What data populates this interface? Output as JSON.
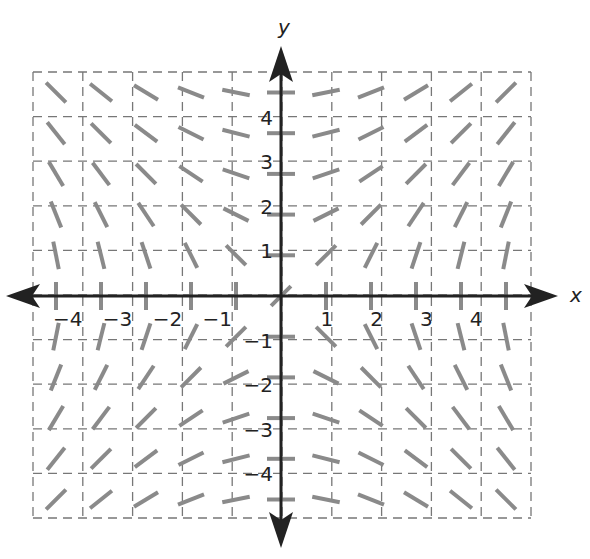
{
  "chart_data": {
    "type": "slope_field",
    "equation": "dy/dx = x/y",
    "title": "",
    "xlabel": "x",
    "ylabel": "y",
    "xlim": [
      -5,
      5
    ],
    "ylim": [
      -5,
      5
    ],
    "grid": true,
    "grid_style": "dashed",
    "x_tick_labels": [
      "−4",
      "−3",
      "−2",
      "−1",
      "1",
      "2",
      "3",
      "4"
    ],
    "x_tick_values": [
      -4,
      -3,
      -2,
      -1,
      1,
      2,
      3,
      4
    ],
    "y_tick_labels": [
      "4",
      "3",
      "2",
      "1",
      "−1",
      "−2",
      "−3",
      "−4"
    ],
    "y_tick_values": [
      4,
      3,
      2,
      1,
      -1,
      -2,
      -3,
      -4
    ],
    "sample_points_x": [
      -5,
      -4,
      -3,
      -2,
      -1,
      0,
      1,
      2,
      3,
      4,
      5
    ],
    "sample_points_y": [
      -5,
      -4,
      -3,
      -2,
      -1,
      0,
      1,
      2,
      3,
      4,
      5
    ],
    "segment_color": "#8a8a8a",
    "grid_color": "#777777",
    "axis_color": "#222222"
  }
}
